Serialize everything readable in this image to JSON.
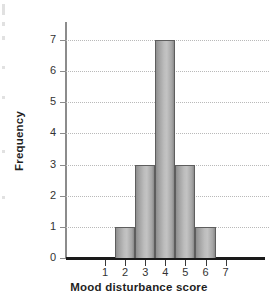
{
  "chart_data": {
    "type": "bar",
    "title": "",
    "subtitle": "",
    "xlabel": "Mood disturbance score",
    "ylabel": "Frequency",
    "categories": [
      "1",
      "2",
      "3",
      "4",
      "5",
      "6",
      "7"
    ],
    "values": [
      0,
      1,
      3,
      7,
      3,
      1,
      0
    ],
    "bars": [
      {
        "category": "2",
        "value": 1
      },
      {
        "category": "3",
        "value": 3
      },
      {
        "category": "4",
        "value": 7
      },
      {
        "category": "5",
        "value": 3
      },
      {
        "category": "6",
        "value": 1
      }
    ],
    "xlim": [
      0.5,
      7.5
    ],
    "ylim": [
      0,
      7
    ],
    "xticks": [
      "1",
      "2",
      "3",
      "4",
      "5",
      "6",
      "7"
    ],
    "yticks": [
      "0",
      "1",
      "2",
      "3",
      "4",
      "5",
      "6",
      "7"
    ],
    "grid": true,
    "grid_axis": "y",
    "grid_style": "dotted",
    "legend": false,
    "legend_position": "none",
    "annotations": [],
    "colors": {
      "bar_fill_light": "#c3c3c3",
      "bar_fill_dark": "#8a8a8a",
      "bar_border": "#5e5e5e",
      "gridline": "#b9b9b9",
      "x_axis": "#1a1a1a",
      "y_axis": "#8c8c8c",
      "text": "#1f1f1f",
      "background": "#ffffff"
    }
  }
}
